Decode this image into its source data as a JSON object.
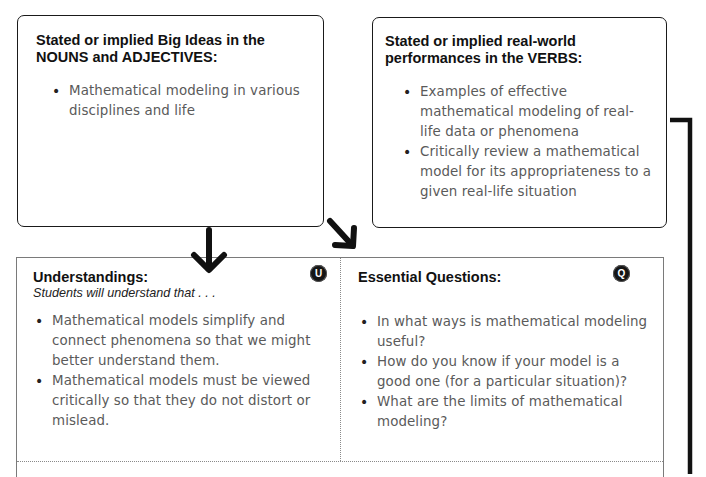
{
  "big_ideas": {
    "title": "Stated or implied Big Ideas in the NOUNS and ADJECTIVES:",
    "items": [
      "Mathematical modeling in various disciplines and life"
    ]
  },
  "performances": {
    "title": "Stated or implied real-world performances in the VERBS:",
    "items": [
      "Examples of effective mathematical modeling of real-life data or phenomena",
      "Critically review a mathematical model for its appropriateness to a given real-life situation"
    ]
  },
  "understandings": {
    "title": "Understandings:",
    "subtitle": "Students will understand that . . .",
    "badge": "U",
    "items": [
      "Mathematical models simplify and connect phenomena so that  we might better understand them.",
      "Mathematical models must be viewed critically so that they do not distort or mislead."
    ]
  },
  "essential_questions": {
    "title": "Essential Questions:",
    "badge": "Q",
    "items": [
      "In what ways is mathematical modeling useful?",
      "How do you know if your model is a good one (for a particular situation)?",
      "What are the limits of mathematical modeling?"
    ]
  },
  "connectors": {
    "color": "#111111",
    "arrows": [
      "down-arrow",
      "diagonal-down-right-arrow"
    ],
    "bracket": "right-side-bracket-line"
  }
}
